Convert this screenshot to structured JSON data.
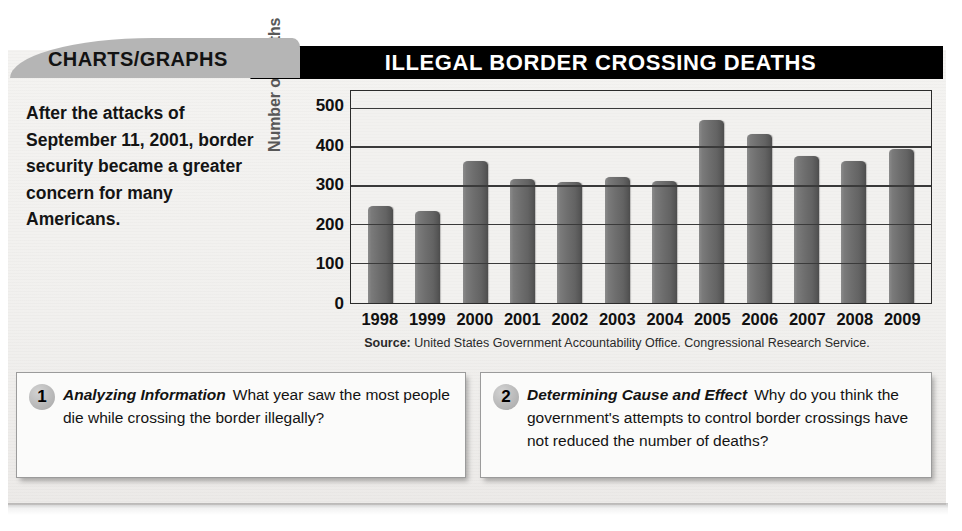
{
  "header": {
    "tab_label": "CHARTS/GRAPHS",
    "title": "ILLEGAL BORDER CROSSING DEATHS"
  },
  "intro": {
    "text": "After the attacks of September 11, 2001, border security became a greater concern for many Americans."
  },
  "source": {
    "label": "Source:",
    "text": "United States Government Accountability Office. Congressional Research Service."
  },
  "questions": [
    {
      "number": "1",
      "lead": "Analyzing Information",
      "body": "What year saw the most people die while crossing the border illegally?"
    },
    {
      "number": "2",
      "lead": "Determining Cause and Effect",
      "body": "Why do you think the government's attempts to control border crossings have not reduced the number of deaths?"
    }
  ],
  "chart_data": {
    "type": "bar",
    "title": "ILLEGAL BORDER CROSSING DEATHS",
    "xlabel": "",
    "ylabel": "Number of deaths",
    "categories": [
      "1998",
      "1999",
      "2000",
      "2001",
      "2002",
      "2003",
      "2004",
      "2005",
      "2006",
      "2007",
      "2008",
      "2009"
    ],
    "values": [
      249,
      236,
      367,
      320,
      311,
      324,
      314,
      472,
      435,
      378,
      365,
      397
    ],
    "ylim": [
      0,
      500
    ],
    "yticks": [
      0,
      100,
      200,
      300,
      400,
      500
    ],
    "grid": true,
    "legend": "none",
    "bar_color": "#6e6e6e",
    "plot_bg": "#f2f1ef"
  },
  "colors": {
    "title_bar": "#000000",
    "tab": "#b5b5b5",
    "paper": "#f1f0ee",
    "bar": "#6e6e6e",
    "axis_title": "#585858"
  }
}
